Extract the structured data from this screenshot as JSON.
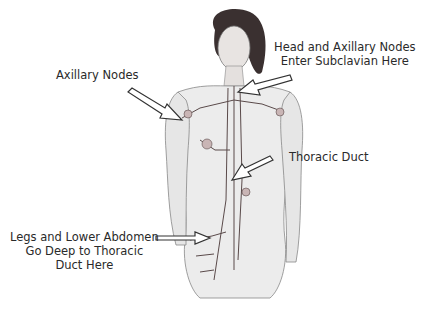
{
  "diagram": {
    "labels": [
      {
        "id": "axillary",
        "lines": [
          "Axillary Nodes"
        ]
      },
      {
        "id": "subclavian",
        "lines": [
          "Head and Axillary Nodes",
          "Enter Subclavian Here"
        ]
      },
      {
        "id": "thoracic",
        "lines": [
          "Thoracic Duct"
        ]
      },
      {
        "id": "legs",
        "lines": [
          "Legs and Lower Abdomen",
          "Go Deep to Thoracic",
          "Duct Here"
        ]
      }
    ],
    "colors": {
      "background": "#ffffff",
      "text": "#2a2a2a",
      "arrow_fill": "#ffffff",
      "arrow_stroke": "#333333",
      "vessel": "#5a4a4a",
      "skin_shade": "#d8d8d8",
      "hair": "#3a3030"
    }
  }
}
